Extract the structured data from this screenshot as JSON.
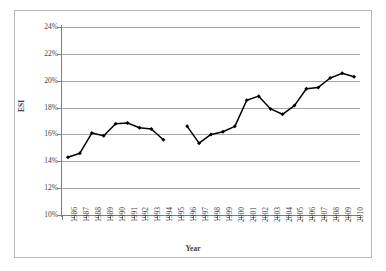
{
  "chart_data": {
    "type": "line",
    "title": "",
    "xlabel": "Year",
    "ylabel": "ESI",
    "ylim": [
      10,
      24
    ],
    "ytick_labels": [
      "24%",
      "22%",
      "20%",
      "18%",
      "16%",
      "14%",
      "12%",
      "10%"
    ],
    "ytick_values": [
      24,
      22,
      20,
      18,
      16,
      14,
      12,
      10
    ],
    "grid": true,
    "legend": false,
    "marker": "filled-diamond",
    "line_color": "#000000",
    "marker_color": "#000000",
    "gridline_color": "#A6A6A6",
    "axis_color": "#7F7F7F",
    "background": "#FFFFFF",
    "categories": [
      "1986",
      "1987",
      "1988",
      "1989",
      "1990",
      "1991",
      "1992",
      "1993",
      "1994",
      "1995",
      "1996",
      "1997",
      "1998",
      "1999",
      "2000",
      "2001",
      "2002",
      "2003",
      "2004",
      "2005",
      "2006",
      "2007",
      "2008",
      "2009",
      "2010"
    ],
    "series": [
      {
        "name": "ESI",
        "values": [
          14.3,
          14.6,
          16.1,
          15.9,
          16.8,
          16.85,
          16.5,
          16.4,
          15.6,
          null,
          16.6,
          15.35,
          16.0,
          16.2,
          16.6,
          18.55,
          18.85,
          17.9,
          17.5,
          18.15,
          19.4,
          19.5,
          20.2,
          20.55,
          20.3
        ]
      }
    ]
  },
  "axes": {
    "y_title": "ESI",
    "x_title": "Year"
  }
}
